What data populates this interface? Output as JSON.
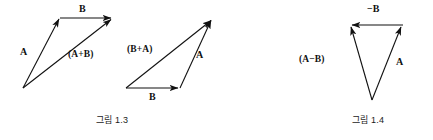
{
  "page": {
    "background": "#ffffff",
    "ink": "#111111",
    "width": 433,
    "height": 140
  },
  "figures": [
    {
      "id": "fig-1-3",
      "caption": "그림 1.3",
      "caption_x": 96,
      "caption_y": 116,
      "panels": [
        {
          "id": "panel-a-plus-b",
          "labels": [
            {
              "name": "vector-label-a",
              "text": "A",
              "x": 20,
              "y": 48
            },
            {
              "name": "vector-label-b",
              "text": "B",
              "x": 79,
              "y": 5
            },
            {
              "name": "vector-label-a-plus-b",
              "text": "(A+B)",
              "x": 68,
              "y": 50
            }
          ],
          "arrows": [
            {
              "name": "arrow-a",
              "x1": 23,
              "y1": 88,
              "x2": 59,
              "y2": 19
            },
            {
              "name": "arrow-b",
              "x1": 60,
              "y1": 18,
              "x2": 113,
              "y2": 18
            },
            {
              "name": "arrow-a-plus-b",
              "x1": 23,
              "y1": 88,
              "x2": 113,
              "y2": 19
            }
          ]
        },
        {
          "id": "panel-b-plus-a",
          "labels": [
            {
              "name": "vector-label-b-plus-a",
              "text": "(B+A)",
              "x": 128,
              "y": 45
            },
            {
              "name": "vector-label-a",
              "text": "A",
              "x": 196,
              "y": 50
            },
            {
              "name": "vector-label-b",
              "text": "B",
              "x": 150,
              "y": 94
            }
          ],
          "arrows": [
            {
              "name": "arrow-b",
              "x1": 126,
              "y1": 88,
              "x2": 180,
              "y2": 88
            },
            {
              "name": "arrow-a",
              "x1": 180,
              "y1": 88,
              "x2": 213,
              "y2": 19
            },
            {
              "name": "arrow-b-plus-a",
              "x1": 126,
              "y1": 88,
              "x2": 213,
              "y2": 19
            }
          ]
        }
      ]
    },
    {
      "id": "fig-1-4",
      "caption": "그림 1.4",
      "caption_x": 352,
      "caption_y": 116,
      "panels": [
        {
          "id": "panel-a-minus-b",
          "labels": [
            {
              "name": "vector-label-minus-b",
              "text": "−B",
              "x": 368,
              "y": 5
            },
            {
              "name": "vector-label-a-minus-b",
              "text": "(A−B)",
              "x": 300,
              "y": 55
            },
            {
              "name": "vector-label-a",
              "text": "A",
              "x": 396,
              "y": 58
            }
          ],
          "arrows": [
            {
              "name": "arrow-minus-b",
              "x1": 402,
              "y1": 25,
              "x2": 350,
              "y2": 25
            },
            {
              "name": "arrow-a",
              "x1": 372,
              "y1": 100,
              "x2": 403,
              "y2": 26
            },
            {
              "name": "arrow-a-minus-b",
              "x1": 372,
              "y1": 100,
              "x2": 349,
              "y2": 26
            }
          ]
        }
      ]
    }
  ]
}
